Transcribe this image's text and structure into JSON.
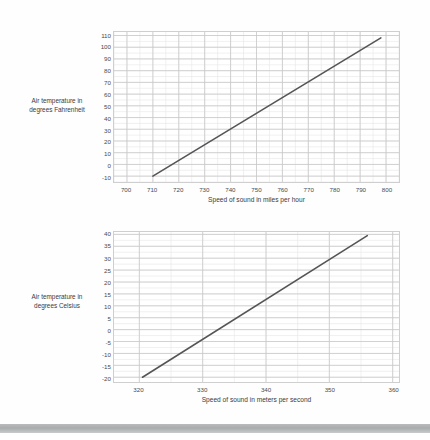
{
  "chart_data": [
    {
      "id": "fahrenheit",
      "type": "line",
      "title": "",
      "xlabel": "Speed of sound in miles per hour",
      "ylabel": "Air temperature in degrees Fahrenheit",
      "ylabel_lines": [
        "Air temperature in",
        "degrees Fahrenheit"
      ],
      "xlim": [
        695,
        805
      ],
      "ylim": [
        -15,
        113
      ],
      "xticks": [
        700,
        710,
        720,
        730,
        740,
        750,
        760,
        770,
        780,
        790,
        800
      ],
      "yticks": [
        -10,
        0,
        10,
        20,
        30,
        40,
        50,
        60,
        70,
        80,
        90,
        100,
        110
      ],
      "xtick_labels": [
        "700",
        "710",
        "720",
        "730",
        "740",
        "750",
        "760",
        "770",
        "780",
        "790",
        "800"
      ],
      "ytick_labels": [
        "-10",
        "0",
        "10",
        "20",
        "30",
        "40",
        "50",
        "60",
        "70",
        "80",
        "90",
        "100",
        "110"
      ],
      "grid": true,
      "minor_grid": true,
      "legend": "none",
      "series": [
        {
          "name": "Speed of sound vs air temperature (Fahrenheit)",
          "x": [
            710.0,
            798.0
          ],
          "y": [
            -10.0,
            108.0
          ],
          "color": "#555558",
          "width": 1.6
        }
      ]
    },
    {
      "id": "celsius",
      "type": "line",
      "title": "",
      "xlabel": "Speed of sound in meters per second",
      "ylabel": "Air temperature in degrees Celsius",
      "ylabel_lines": [
        "Air temperature in",
        "degrees Celsius"
      ],
      "xlim": [
        316,
        361
      ],
      "ylim": [
        -22,
        41
      ],
      "xticks": [
        320,
        330,
        340,
        350,
        360
      ],
      "yticks": [
        -20,
        -15,
        -10,
        -5,
        0,
        5,
        10,
        15,
        20,
        25,
        30,
        35,
        40
      ],
      "xtick_labels": [
        "320",
        "330",
        "340",
        "350",
        "360"
      ],
      "ytick_labels": [
        "-20",
        "-15",
        "-10",
        "-5",
        "0",
        "5",
        "10",
        "15",
        "20",
        "25",
        "30",
        "35",
        "40"
      ],
      "grid": true,
      "minor_grid": true,
      "legend": "none",
      "series": [
        {
          "name": "Speed of sound vs air temperature (Celsius)",
          "x": [
            320.5,
            356.0
          ],
          "y": [
            -20.0,
            39.5
          ],
          "color": "#555558",
          "width": 1.6
        }
      ]
    }
  ],
  "style": {
    "background": "#fefefe",
    "grid_major_color": "#c9c9c9",
    "grid_minor_color": "#e6e6e6",
    "axis_border_color": "#cfcfcf",
    "text_color": "#3b3b3b",
    "band_color": "#aeb1b3"
  }
}
